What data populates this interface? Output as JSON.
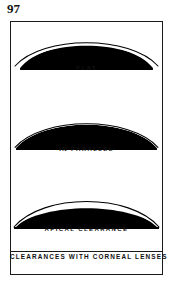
{
  "page": {
    "page_number": "97",
    "background_color": "#ffffff",
    "ink_color": "#111111"
  },
  "figure": {
    "caption": "CLEARANCES WITH CORNEAL LENSES",
    "frame_color": "#1a1a1a",
    "panels": [
      {
        "id": "flat",
        "label": "FLAT",
        "description": "Lens arc flatter than cornea: touches at apex, clearance increases toward the periphery",
        "cornea_fill": "#000000",
        "lens_stroke": "#000000"
      },
      {
        "id": "parallel",
        "label": "IN PARALLEL",
        "description": "Lens arc parallel to cornea: thin even clearance across the whole surface",
        "cornea_fill": "#000000",
        "lens_stroke": "#000000"
      },
      {
        "id": "apical",
        "label": "APICAL CLEARANCE",
        "description": "Lens arc steeper than cornea: maximum clearance at the apex, touching at the edges",
        "cornea_fill": "#000000",
        "lens_stroke": "#000000"
      }
    ]
  }
}
